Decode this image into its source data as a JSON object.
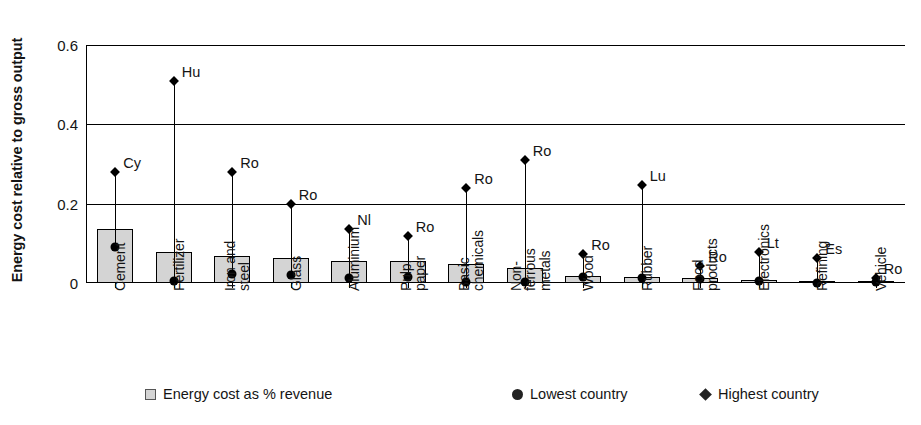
{
  "chart_data": {
    "type": "bar",
    "title": "",
    "xlabel": "",
    "ylabel": "Energy cost relative to gross output",
    "ylim": [
      0,
      0.6
    ],
    "yticks": [
      "0",
      "0.2",
      "0.4",
      "0.6"
    ],
    "ytick_values": [
      0,
      0.2,
      0.4,
      0.6
    ],
    "grid": true,
    "legend_position": "bottom",
    "categories": [
      "Cement",
      "Fertilizer",
      "Iron and\nsteel",
      "Glass",
      "Aluminium",
      "Pulp,\npaper",
      "Basic\nchemicals",
      "Non-\nferrous\nmetals",
      "Wood",
      "Rubber",
      "Food\nproducts",
      "Electronics",
      "Refining",
      "Vehicle"
    ],
    "category_lines": [
      [
        "Cement"
      ],
      [
        "Fertilizer"
      ],
      [
        "Iron and",
        "steel"
      ],
      [
        "Glass"
      ],
      [
        "Aluminium"
      ],
      [
        "Pulp,",
        "paper"
      ],
      [
        "Basic",
        "chemicals"
      ],
      [
        "Non-",
        "ferrous",
        "metals"
      ],
      [
        "Wood"
      ],
      [
        "Rubber"
      ],
      [
        "Food",
        "products"
      ],
      [
        "Electronics"
      ],
      [
        "Refining"
      ],
      [
        "Vehicle"
      ]
    ],
    "series": [
      {
        "name": "Energy cost as % revenue",
        "marker": "square",
        "values": [
          0.137,
          0.077,
          0.069,
          0.063,
          0.056,
          0.055,
          0.048,
          0.039,
          0.018,
          0.014,
          0.013,
          0.008,
          0.002,
          0.002
        ]
      },
      {
        "name": "Lowest country",
        "marker": "circle",
        "values": [
          0.09,
          0.005,
          0.022,
          0.021,
          0.012,
          0.015,
          0.003,
          0.003,
          0.016,
          0.013,
          0.01,
          0.006,
          0.001,
          0.002
        ]
      },
      {
        "name": "Highest country",
        "marker": "diamond",
        "values": [
          0.281,
          0.51,
          0.281,
          0.2,
          0.135,
          0.118,
          0.24,
          0.31,
          0.072,
          0.247,
          0.043,
          0.079,
          0.064,
          0.012
        ]
      }
    ],
    "point_labels": [
      "Cy",
      "Hu",
      "Ro",
      "Ro",
      "Nl",
      "Ro",
      "Ro",
      "Ro",
      "Ro",
      "Lu",
      "Ro",
      "Lt",
      "Es",
      "Ro"
    ],
    "colors": {
      "bar_fill": "#d4d4d4",
      "bar_edge": "#000000",
      "marker": "#000000",
      "axis": "#000000",
      "text": "#141414"
    }
  },
  "legend": {
    "items": [
      {
        "label": "Energy cost as % revenue",
        "marker": "square"
      },
      {
        "label": "Lowest country",
        "marker": "circle"
      },
      {
        "label": "Highest country",
        "marker": "diamond"
      }
    ]
  }
}
